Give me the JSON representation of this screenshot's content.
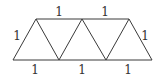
{
  "diagram": {
    "title": "",
    "vertices": {
      "b0": [
        13,
        60
      ],
      "b1": [
        59,
        60
      ],
      "b2": [
        106,
        60
      ],
      "b3": [
        152,
        60
      ],
      "t0": [
        36,
        19
      ],
      "t1": [
        82,
        19
      ],
      "t2": [
        129,
        19
      ]
    },
    "edges": [
      {
        "from": "b0",
        "to": "b3",
        "label": ""
      },
      {
        "from": "t0",
        "to": "t2",
        "label": ""
      },
      {
        "from": "b0",
        "to": "t0"
      },
      {
        "from": "t0",
        "to": "b1"
      },
      {
        "from": "b1",
        "to": "t1"
      },
      {
        "from": "t1",
        "to": "b2"
      },
      {
        "from": "b2",
        "to": "t2"
      },
      {
        "from": "t2",
        "to": "b3"
      }
    ],
    "labels": {
      "top_1": "1",
      "top_2": "1",
      "left": "1",
      "right": "1",
      "bottom_1": "1",
      "bottom_2": "1",
      "bottom_3": "1"
    },
    "stroke_color": "#3a3a3a"
  }
}
